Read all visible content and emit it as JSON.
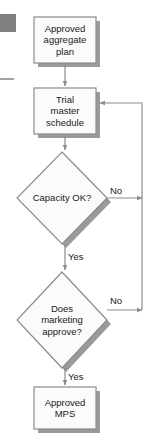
{
  "diagram": {
    "colors": {
      "node_fill": "#fbfbfb",
      "node_stroke": "#8c8c8c",
      "shadow": "#9a9a9a",
      "connector": "#8c8c8c",
      "text": "#1a1a1a",
      "marker_square": "#808080"
    },
    "marker": {
      "square_label": "page-marker-square",
      "rule_label": "page-margin-rule"
    },
    "nodes": [
      {
        "id": "approved-aggregate-plan",
        "shape": "process",
        "text": "Approved\naggregate\nplan",
        "x": 34,
        "y": 17,
        "w": 62,
        "h": 46
      },
      {
        "id": "trial-master-schedule",
        "shape": "process",
        "text": "Trial\nmaster\nschedule",
        "x": 34,
        "y": 88,
        "w": 62,
        "h": 46
      },
      {
        "id": "capacity-ok",
        "shape": "decision",
        "text": "Capacity OK?",
        "cx": 62,
        "cy": 198,
        "rx": 45,
        "ry": 46
      },
      {
        "id": "does-marketing-approve",
        "shape": "decision",
        "text": "Does\nmarketing\napprove?",
        "cx": 62,
        "cy": 320,
        "rx": 45,
        "ry": 48
      },
      {
        "id": "approved-mps",
        "shape": "process",
        "text": "Approved\nMPS",
        "x": 34,
        "y": 387,
        "w": 62,
        "h": 42
      }
    ],
    "edge_labels": [
      {
        "id": "capacity-no",
        "text": "No",
        "x": 110,
        "y": 186
      },
      {
        "id": "capacity-yes",
        "text": "Yes",
        "x": 68,
        "y": 252
      },
      {
        "id": "marketing-no",
        "text": "No",
        "x": 110,
        "y": 296
      },
      {
        "id": "marketing-yes",
        "text": "Yes",
        "x": 68,
        "y": 372
      }
    ]
  }
}
